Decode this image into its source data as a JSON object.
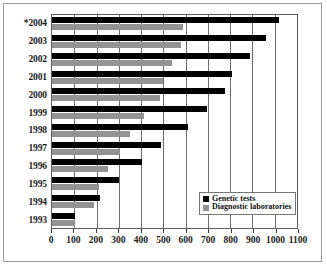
{
  "chart_data": {
    "type": "bar",
    "orientation": "horizontal",
    "title": "",
    "xlabel": "",
    "ylabel": "",
    "xlim": [
      0,
      1100
    ],
    "xticks": [
      0,
      100,
      200,
      300,
      400,
      500,
      600,
      700,
      800,
      900,
      1000,
      1100
    ],
    "grid": true,
    "legend_position": "bottom-right",
    "categories": [
      "*2004",
      "2003",
      "2002",
      "2001",
      "2000",
      "1999",
      "1998",
      "1997",
      "1996",
      "1995",
      "1994",
      "1993"
    ],
    "series": [
      {
        "name": "Genetic tests",
        "color": "#000000",
        "values": [
          1020,
          960,
          890,
          810,
          775,
          695,
          610,
          490,
          405,
          300,
          215,
          105
        ]
      },
      {
        "name": "Diagnostic laboratories",
        "color": "#939393",
        "values": [
          590,
          580,
          540,
          500,
          485,
          415,
          350,
          305,
          250,
          210,
          190,
          105
        ]
      }
    ]
  },
  "legend": {
    "items": [
      {
        "label": "Genetic tests"
      },
      {
        "label": "Diagnostic laboratories"
      }
    ]
  }
}
